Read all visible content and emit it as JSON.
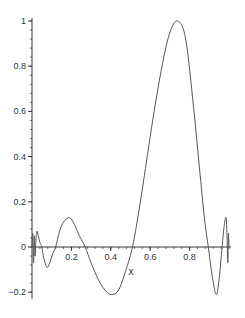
{
  "chart_data": {
    "type": "line",
    "title": "",
    "xlabel": "x",
    "ylabel": "",
    "xlim": [
      0,
      1
    ],
    "ylim": [
      -0.22,
      1.0
    ],
    "grid": false,
    "legend": null,
    "x_ticks": [
      "0.2",
      "0.4",
      "0.6",
      "0.8"
    ],
    "x_tick_values": [
      0.2,
      0.4,
      0.6,
      0.8
    ],
    "y_ticks": [
      "-0.2",
      "0",
      "0.2",
      "0.4",
      "0.6",
      "0.8",
      "1"
    ],
    "y_tick_values": [
      -0.2,
      0,
      0.2,
      0.4,
      0.6,
      0.8,
      1
    ],
    "series": [
      {
        "name": "f(x)",
        "color": "#555555",
        "x": [
          0.0,
          0.004,
          0.008,
          0.012,
          0.016,
          0.02,
          0.025,
          0.032,
          0.04,
          0.05,
          0.06,
          0.076,
          0.09,
          0.105,
          0.12,
          0.14,
          0.16,
          0.19,
          0.215,
          0.24,
          0.27,
          0.3,
          0.34,
          0.38,
          0.41,
          0.44,
          0.47,
          0.51,
          0.55,
          0.59,
          0.62,
          0.66,
          0.7,
          0.74,
          0.78,
          0.82,
          0.85,
          0.875,
          0.895,
          0.915,
          0.935,
          0.95,
          0.965,
          0.975,
          0.985,
          0.99,
          0.994,
          0.997,
          1.0
        ],
        "y": [
          0.0,
          0.06,
          -0.07,
          0.05,
          -0.04,
          0.03,
          0.07,
          0.05,
          0.02,
          0.0,
          -0.05,
          -0.09,
          -0.07,
          -0.03,
          0.0,
          0.07,
          0.11,
          0.13,
          0.1,
          0.05,
          0.0,
          -0.07,
          -0.15,
          -0.2,
          -0.21,
          -0.19,
          -0.12,
          0.0,
          0.2,
          0.43,
          0.6,
          0.8,
          0.95,
          1.0,
          0.92,
          0.62,
          0.35,
          0.13,
          0.0,
          -0.13,
          -0.21,
          -0.14,
          0.0,
          0.09,
          0.13,
          0.05,
          -0.07,
          0.06,
          0.0
        ]
      }
    ]
  }
}
